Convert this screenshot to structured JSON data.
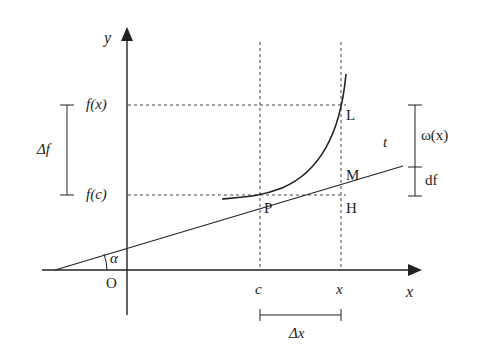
{
  "diagram": {
    "labels": {
      "y_axis": "y",
      "x_axis": "x",
      "origin": "O",
      "alpha": "α",
      "fx": "f(x)",
      "fc": "f(c)",
      "delta_f": "Δf",
      "delta_x": "Δx",
      "c": "c",
      "x_point": "x",
      "P": "P",
      "L": "L",
      "M": "M",
      "H": "H",
      "t": "t",
      "omega": "ω(x)",
      "df": "df"
    },
    "colors": {
      "stroke": "#222222",
      "dashed": "#444444",
      "background": "#ffffff"
    }
  }
}
